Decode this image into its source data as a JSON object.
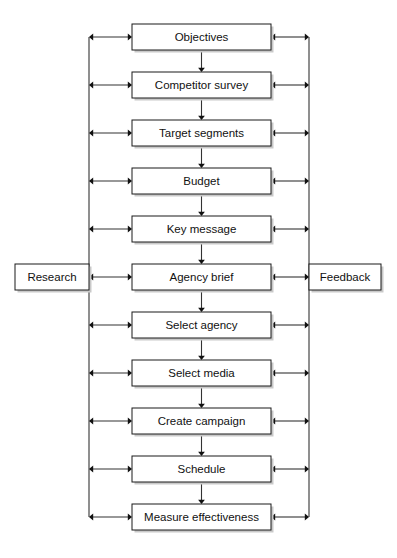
{
  "diagram": {
    "type": "flowchart",
    "orientation": "vertical",
    "colors": {
      "box_border": "#1a1a1a",
      "box_fill": "#ffffff",
      "line": "#333333",
      "text": "#111111",
      "shadow": "#c9c9c9",
      "background": "#ffffff"
    },
    "steps": [
      {
        "id": "objectives",
        "label": "Objectives",
        "order": 1
      },
      {
        "id": "competitor-survey",
        "label": "Competitor survey",
        "order": 2
      },
      {
        "id": "target-segments",
        "label": "Target segments",
        "order": 3
      },
      {
        "id": "budget",
        "label": "Budget",
        "order": 4
      },
      {
        "id": "key-message",
        "label": "Key message",
        "order": 5
      },
      {
        "id": "agency-brief",
        "label": "Agency brief",
        "order": 6
      },
      {
        "id": "select-agency",
        "label": "Select agency",
        "order": 7
      },
      {
        "id": "select-media",
        "label": "Select media",
        "order": 8
      },
      {
        "id": "create-campaign",
        "label": "Create campaign",
        "order": 9
      },
      {
        "id": "schedule",
        "label": "Schedule",
        "order": 10
      },
      {
        "id": "measure-effectiveness",
        "label": "Measure effectiveness",
        "order": 11
      }
    ],
    "side_boxes": {
      "left": {
        "id": "research",
        "label": "Research",
        "attached_to": "agency-brief"
      },
      "right": {
        "id": "feedback",
        "label": "Feedback",
        "attached_to": "agency-brief"
      }
    },
    "geometry": {
      "width": 397,
      "height": 558,
      "box_left": 132,
      "box_right": 271,
      "box_height": 26,
      "first_box_top": 24,
      "row_pitch": 48,
      "left_spine_x": 89,
      "right_spine_x": 309,
      "research_box_left": 15,
      "research_box_right": 89,
      "feedback_box_left": 309,
      "feedback_box_right": 381,
      "side_box_top": 264,
      "side_box_height": 26
    },
    "connections": {
      "vertical_flow": "each step flows downward to the next step",
      "lateral": "every step is linked by a double-headed arrow to both the left research spine and the right feedback spine"
    }
  }
}
